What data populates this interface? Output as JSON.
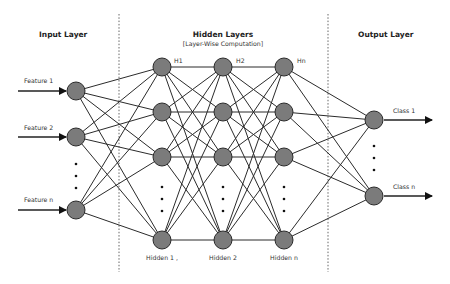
{
  "diagram": {
    "type": "neural-network",
    "sections": {
      "input": {
        "title": "Input Layer"
      },
      "hidden": {
        "title": "Hidden Layers",
        "subtitle": "[Layer-Wise Computation]"
      },
      "output": {
        "title": "Output Layer"
      }
    },
    "input_features": [
      "Feature 1",
      "Feature 2",
      "Feature n"
    ],
    "hidden_layers": [
      {
        "top_label": "H1",
        "bottom_label": "Hidden 1 ,"
      },
      {
        "top_label": "H2",
        "bottom_label": "Hidden 2"
      },
      {
        "top_label": "Hn",
        "bottom_label": "Hidden n"
      }
    ],
    "output_classes": [
      "Class 1",
      "Class n"
    ],
    "ellipsis": "⋮",
    "colors": {
      "node_fill": "#7b7b7b",
      "node_stroke": "#2a2a2a",
      "connection": "#2b2b2b",
      "divider": "#666666",
      "text": "#222222"
    }
  }
}
